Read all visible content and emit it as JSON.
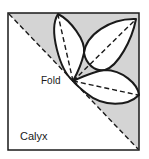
{
  "diagram": {
    "labels": {
      "fold": "Fold",
      "calyx": "Calyx"
    },
    "colors": {
      "background": "#ffffff",
      "shaded_region": "#d4d4d4",
      "outline": "#1a1a1a",
      "fold_lines": "#1a1a1a"
    },
    "shapes": {
      "square": "folded paper square",
      "diagonal": "dashed fold line from top-left to bottom-right corner",
      "petals": [
        "top petal",
        "upper-right petal",
        "right petal"
      ],
      "petal_center_lines": 3
    }
  }
}
